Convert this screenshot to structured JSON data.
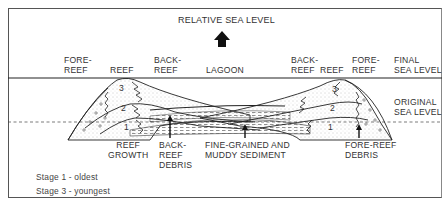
{
  "title": "RELATIVE SEA LEVEL",
  "top_labels": {
    "left_fore_reef": "FORE-\nREEF",
    "left_reef": "REEF",
    "left_back_reef": "BACK-\nREEF",
    "lagoon": "LAGOON",
    "right_back_reef": "BACK-\nREEF",
    "right_reef": "REEF",
    "right_fore_reef": "FORE-\nREEF",
    "final_sea_level": "FINAL\nSEA LEVEL"
  },
  "side_labels": {
    "original_sea_level": "ORIGINAL\nSEA LEVEL"
  },
  "bottom_labels": {
    "reef_growth": "REEF\nGROWTH",
    "back_reef_debris": "BACK-\nREEF\nDEBRIS",
    "fine_grained_sediment": "FINE-GRAINED AND\nMUDDY SEDIMENT",
    "fore_reef_debris": "FORE-REEF\nDEBRIS"
  },
  "stages": {
    "left": [
      "1",
      "2",
      "3"
    ],
    "right": [
      "1",
      "2",
      "3"
    ]
  },
  "legend": {
    "stage1": "Stage 1 - oldest",
    "stage3": "Stage 3 - youngest"
  },
  "colors": {
    "line": "#222222",
    "stipple": "#9a9a9a",
    "background": "#ffffff"
  }
}
